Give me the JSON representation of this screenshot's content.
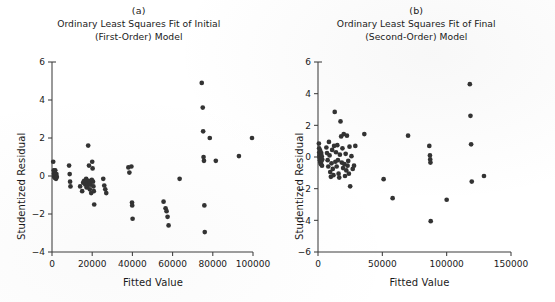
{
  "figure": {
    "background_color": "#ffffff",
    "marker_color": "#333333",
    "axis_color": "#3d3d3d"
  },
  "panels": [
    {
      "letter": "(a)",
      "title_line1": "Ordinary Least Squares Fit of Initial",
      "title_line2": "(First-Order) Model",
      "xlabel": "Fitted Value",
      "ylabel": "Studentized Residual",
      "xticks": [
        "0",
        "20000",
        "40000",
        "60000",
        "80000",
        "100000"
      ],
      "yticks": [
        "6",
        "4",
        "2",
        "0",
        "-2",
        "-4"
      ]
    },
    {
      "letter": "(b)",
      "title_line1": "Ordinary Least Squares Fit of Final",
      "title_line2": "(Second-Order) Model",
      "xlabel": "Fitted Value",
      "ylabel": "Studentized Residual",
      "xticks": [
        "0",
        "50000",
        "100000",
        "150000"
      ],
      "yticks": [
        "6",
        "4",
        "2",
        "0",
        "-2",
        "-4",
        "-6"
      ]
    }
  ],
  "chart_data": [
    {
      "type": "scatter",
      "panel": "(a)",
      "title": "Ordinary Least Squares Fit of Initial (First-Order) Model",
      "xlabel": "Fitted Value",
      "ylabel": "Studentized Residual",
      "xlim": [
        0,
        100000
      ],
      "ylim": [
        -4,
        6
      ],
      "xticks": [
        0,
        20000,
        40000,
        60000,
        80000,
        100000
      ],
      "yticks": [
        -4,
        -2,
        0,
        2,
        4,
        6
      ],
      "grid": false,
      "legend": null,
      "series": [
        {
          "name": "residuals",
          "points": [
            [
              600,
              0.75
            ],
            [
              900,
              0.3
            ],
            [
              1000,
              0.12
            ],
            [
              1100,
              -0.05
            ],
            [
              1200,
              0.2
            ],
            [
              1300,
              0.02
            ],
            [
              1500,
              -0.1
            ],
            [
              1600,
              0.3
            ],
            [
              1800,
              0.05
            ],
            [
              2000,
              -0.15
            ],
            [
              2200,
              0.1
            ],
            [
              2400,
              -0.05
            ],
            [
              8500,
              0.55
            ],
            [
              8800,
              0.1
            ],
            [
              9000,
              -0.3
            ],
            [
              9200,
              -0.55
            ],
            [
              14000,
              -0.55
            ],
            [
              15000,
              -0.8
            ],
            [
              15500,
              -0.35
            ],
            [
              16000,
              -0.25
            ],
            [
              16500,
              -0.45
            ],
            [
              17000,
              -0.15
            ],
            [
              17200,
              -0.6
            ],
            [
              17500,
              -0.35
            ],
            [
              17800,
              -0.5
            ],
            [
              18000,
              1.6
            ],
            [
              18200,
              -0.25
            ],
            [
              18400,
              0.55
            ],
            [
              18600,
              -0.4
            ],
            [
              18800,
              -0.7
            ],
            [
              19000,
              -0.3
            ],
            [
              19200,
              -0.45
            ],
            [
              19500,
              -0.9
            ],
            [
              19800,
              -0.2
            ],
            [
              20000,
              0.75
            ],
            [
              20200,
              0.4
            ],
            [
              20400,
              -0.3
            ],
            [
              20600,
              -0.55
            ],
            [
              20800,
              -0.8
            ],
            [
              21000,
              -1.5
            ],
            [
              25500,
              -0.15
            ],
            [
              26000,
              -0.5
            ],
            [
              26500,
              -0.7
            ],
            [
              27000,
              -0.9
            ],
            [
              38000,
              0.45
            ],
            [
              38500,
              0.18
            ],
            [
              39500,
              0.5
            ],
            [
              39800,
              -1.4
            ],
            [
              39900,
              -1.55
            ],
            [
              40100,
              -2.25
            ],
            [
              55500,
              -1.35
            ],
            [
              56500,
              -1.7
            ],
            [
              57000,
              -1.85
            ],
            [
              57500,
              -2.15
            ],
            [
              58000,
              -2.6
            ],
            [
              63500,
              -0.15
            ],
            [
              74500,
              4.9
            ],
            [
              75000,
              3.6
            ],
            [
              75200,
              2.35
            ],
            [
              75400,
              1.0
            ],
            [
              75600,
              0.8
            ],
            [
              75800,
              -1.55
            ],
            [
              76000,
              -2.95
            ],
            [
              78500,
              2.0
            ],
            [
              81500,
              0.8
            ],
            [
              93000,
              1.05
            ],
            [
              99500,
              2.0
            ]
          ]
        }
      ]
    },
    {
      "type": "scatter",
      "panel": "(b)",
      "title": "Ordinary Least Squares Fit of Final (Second-Order) Model",
      "xlabel": "Fitted Value",
      "ylabel": "Studentized Residual",
      "xlim": [
        0,
        150000
      ],
      "ylim": [
        -6,
        6
      ],
      "xticks": [
        0,
        50000,
        100000,
        150000
      ],
      "yticks": [
        -6,
        -4,
        -2,
        0,
        2,
        4,
        6
      ],
      "grid": false,
      "legend": null,
      "series": [
        {
          "name": "residuals",
          "points": [
            [
              700,
              0.85
            ],
            [
              900,
              0.55
            ],
            [
              1000,
              0.3
            ],
            [
              1100,
              0.1
            ],
            [
              1200,
              -0.05
            ],
            [
              1400,
              0.2
            ],
            [
              1500,
              -0.2
            ],
            [
              1600,
              0.0
            ],
            [
              1700,
              0.4
            ],
            [
              1800,
              -0.35
            ],
            [
              2000,
              0.15
            ],
            [
              2100,
              -0.1
            ],
            [
              2300,
              -0.45
            ],
            [
              2500,
              0.25
            ],
            [
              2700,
              -0.25
            ],
            [
              2900,
              0.05
            ],
            [
              3100,
              -0.55
            ],
            [
              3300,
              -0.15
            ],
            [
              6500,
              0.6
            ],
            [
              7000,
              0.25
            ],
            [
              7500,
              -0.2
            ],
            [
              8000,
              -0.6
            ],
            [
              8500,
              0.95
            ],
            [
              9000,
              0.1
            ],
            [
              9500,
              -0.95
            ],
            [
              10000,
              -1.25
            ],
            [
              10500,
              -0.4
            ],
            [
              11000,
              0.45
            ],
            [
              11500,
              -0.75
            ],
            [
              12000,
              -1.15
            ],
            [
              12500,
              0.7
            ],
            [
              13000,
              2.85
            ],
            [
              13500,
              -0.3
            ],
            [
              14000,
              0.3
            ],
            [
              14500,
              -0.6
            ],
            [
              15000,
              0.75
            ],
            [
              15500,
              -0.2
            ],
            [
              16000,
              -1.05
            ],
            [
              16500,
              -1.3
            ],
            [
              17000,
              0.15
            ],
            [
              17500,
              2.25
            ],
            [
              18000,
              1.3
            ],
            [
              18500,
              -0.35
            ],
            [
              19000,
              0.55
            ],
            [
              19500,
              -0.7
            ],
            [
              20000,
              1.45
            ],
            [
              20500,
              -0.45
            ],
            [
              21000,
              -1.2
            ],
            [
              21500,
              0.2
            ],
            [
              22000,
              -0.85
            ],
            [
              22500,
              1.35
            ],
            [
              23000,
              -0.55
            ],
            [
              23500,
              -0.25
            ],
            [
              24000,
              -1.05
            ],
            [
              24500,
              0.65
            ],
            [
              25000,
              -1.85
            ],
            [
              26000,
              0.05
            ],
            [
              27000,
              -0.75
            ],
            [
              28000,
              -0.55
            ],
            [
              29000,
              0.7
            ],
            [
              36000,
              1.45
            ],
            [
              51000,
              -1.4
            ],
            [
              58000,
              -2.6
            ],
            [
              70000,
              1.35
            ],
            [
              86500,
              0.7
            ],
            [
              87000,
              0.1
            ],
            [
              87200,
              -0.15
            ],
            [
              87400,
              -0.35
            ],
            [
              87600,
              -4.05
            ],
            [
              100000,
              -2.7
            ],
            [
              118000,
              4.6
            ],
            [
              118500,
              2.6
            ],
            [
              119000,
              0.8
            ],
            [
              119500,
              -1.55
            ],
            [
              129000,
              -1.2
            ]
          ]
        }
      ]
    }
  ]
}
